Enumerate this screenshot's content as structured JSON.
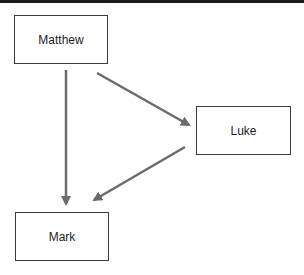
{
  "diagram": {
    "nodes": [
      {
        "id": "matthew",
        "label": "Matthew"
      },
      {
        "id": "luke",
        "label": "Luke"
      },
      {
        "id": "mark",
        "label": "Mark"
      }
    ],
    "edges": [
      {
        "from": "matthew",
        "to": "mark"
      },
      {
        "from": "matthew",
        "to": "luke"
      },
      {
        "from": "luke",
        "to": "mark"
      }
    ],
    "colors": {
      "edge": "#6b6b6b",
      "node_border": "#3a3a3a",
      "text": "#1c1c1c"
    }
  }
}
